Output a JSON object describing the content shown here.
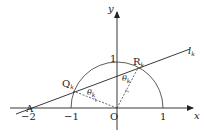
{
  "figure": {
    "type": "geometry-diagram",
    "axes": {
      "x_label": "x",
      "y_label": "y",
      "origin_label": "O",
      "x_ticks": [
        "−2",
        "−1",
        "1"
      ],
      "y_ticks": [
        "1"
      ]
    },
    "curve": {
      "name": "unit-semicircle",
      "radius": 1,
      "center": "O",
      "half": "upper"
    },
    "line": {
      "name": "l",
      "subscript": "k",
      "passes_through": [
        "A",
        "Q_k",
        "R_k"
      ]
    },
    "points": {
      "A": {
        "label": "A",
        "coords": [
          -2,
          0
        ]
      },
      "Q": {
        "label": "Q",
        "subscript": "k"
      },
      "R": {
        "label": "R",
        "subscript": "k"
      },
      "O": {
        "label": "O",
        "coords": [
          0,
          0
        ]
      }
    },
    "angles": [
      {
        "label": "θ",
        "subscript": "k",
        "at": "Q_k"
      },
      {
        "label": "θ",
        "subscript": "k",
        "at": "R_k"
      }
    ],
    "segments": [
      {
        "from": "O",
        "to": "Q_k",
        "style": "dashed",
        "tick_mark": true
      },
      {
        "from": "O",
        "to": "R_k",
        "style": "dashed",
        "tick_mark": true
      }
    ],
    "colors": {
      "stroke": "#222222",
      "background": "#ffffff"
    }
  }
}
